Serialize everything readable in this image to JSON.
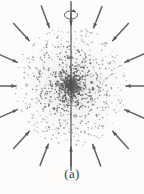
{
  "figure": {
    "caption": "(a)",
    "background_color": "#fdfcfa",
    "ink_color": "#4a4a4a",
    "dot_color": "#5a5a5a",
    "arrow_color": "#555555",
    "axis_color": "#4a4a4a",
    "width": 144,
    "height": 194
  },
  "chart_data": {
    "type": "scatter",
    "title": "",
    "subtitle": "",
    "xlabel": "",
    "ylabel": "",
    "annotations": [
      "(a)"
    ],
    "legend": [],
    "grid": false,
    "xlim": [
      0,
      144
    ],
    "ylim": [
      0,
      194
    ],
    "cloud": {
      "center_x": 71,
      "center_y": 86,
      "radius_x": 56,
      "radius_y": 61,
      "point_count": 1400,
      "density_profile": "center-peaked",
      "dot_radius_min": 0.35,
      "dot_radius_max": 0.95
    },
    "axis": {
      "x": 71,
      "y_top": 13,
      "y_bottom": 166,
      "stroke_width": 1.1,
      "label": "rotation-axis"
    },
    "rotation_marker": {
      "center_x": 71,
      "center_y": 15,
      "rx": 6.5,
      "ry": 4.0,
      "direction": "counterclockwise",
      "label": "rotation-arrow"
    },
    "arrows": [
      {
        "id": 1,
        "angle_deg": 90,
        "tail_r": 80,
        "head_r": 58
      },
      {
        "id": 2,
        "angle_deg": 67,
        "tail_r": 82,
        "head_r": 60
      },
      {
        "id": 3,
        "angle_deg": 45,
        "tail_r": 84,
        "head_r": 61
      },
      {
        "id": 4,
        "angle_deg": 22,
        "tail_r": 82,
        "head_r": 60
      },
      {
        "id": 5,
        "angle_deg": 0,
        "tail_r": 78,
        "head_r": 57
      },
      {
        "id": 6,
        "angle_deg": 338,
        "tail_r": 82,
        "head_r": 60
      },
      {
        "id": 7,
        "angle_deg": 315,
        "tail_r": 84,
        "head_r": 61
      },
      {
        "id": 8,
        "angle_deg": 292,
        "tail_r": 82,
        "head_r": 60
      },
      {
        "id": 9,
        "angle_deg": 270,
        "tail_r": 80,
        "head_r": 58
      },
      {
        "id": 10,
        "angle_deg": 247,
        "tail_r": 82,
        "head_r": 60
      },
      {
        "id": 11,
        "angle_deg": 225,
        "tail_r": 84,
        "head_r": 61
      },
      {
        "id": 12,
        "angle_deg": 202,
        "tail_r": 82,
        "head_r": 60
      },
      {
        "id": 13,
        "angle_deg": 180,
        "tail_r": 78,
        "head_r": 57
      },
      {
        "id": 14,
        "angle_deg": 158,
        "tail_r": 82,
        "head_r": 60
      },
      {
        "id": 15,
        "angle_deg": 135,
        "tail_r": 84,
        "head_r": 61
      },
      {
        "id": 16,
        "angle_deg": 112,
        "tail_r": 82,
        "head_r": 60
      }
    ]
  }
}
